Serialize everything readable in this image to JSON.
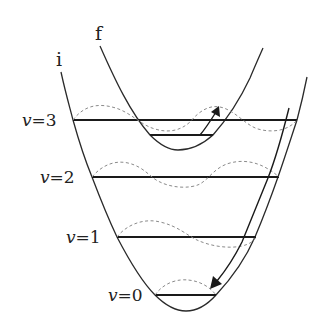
{
  "diagram": {
    "type": "potential-energy-curves",
    "states": [
      {
        "id": "i",
        "label": "i"
      },
      {
        "id": "f",
        "label": "f"
      }
    ],
    "levels": [
      {
        "v_symbol": "v",
        "eq": "=",
        "n": "3",
        "label": "v=3"
      },
      {
        "v_symbol": "v",
        "eq": "=",
        "n": "2",
        "label": "v=2"
      },
      {
        "v_symbol": "v",
        "eq": "=",
        "n": "1",
        "label": "v=1"
      },
      {
        "v_symbol": "v",
        "eq": "=",
        "n": "0",
        "label": "v=0"
      }
    ],
    "transitions": [
      {
        "name": "excitation",
        "from": "f v=0",
        "to": "i v=3",
        "direction": "up"
      },
      {
        "name": "relaxation",
        "from": "i v=3",
        "to": "i v=0",
        "direction": "down"
      }
    ],
    "colors": {
      "curve": "#2a2a2a",
      "level": "#1a1a1a",
      "wave": "#8a8a8a",
      "background": "#ffffff"
    }
  }
}
